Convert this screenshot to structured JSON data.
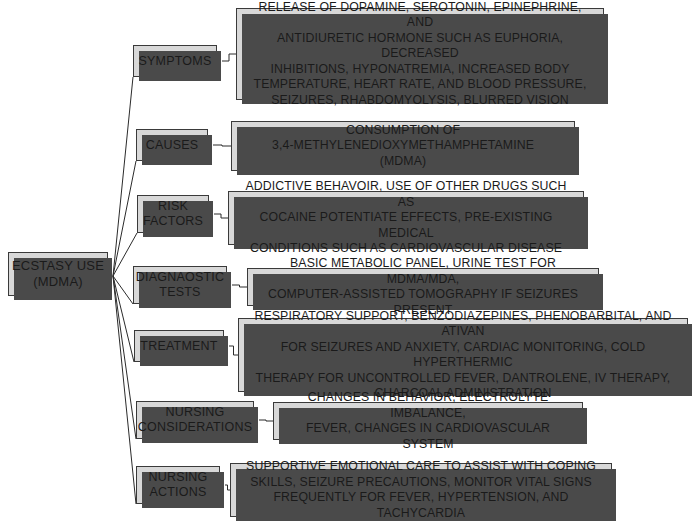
{
  "diagram": {
    "type": "concept-map",
    "background_color": "#ffffff",
    "node_fill_color": "#d8d8d8",
    "node_border_color": "#3a3a3a",
    "node_shadow_color": "#4a4a4a",
    "text_color": "#1a1a1a",
    "root": {
      "label": "ECSTASY USE\n(MDMA)",
      "x": 8,
      "y": 252,
      "width": 100,
      "height": 44
    },
    "branches": [
      {
        "key": "symptoms",
        "label": "SYMPTOMS",
        "label_box": {
          "x": 133,
          "y": 45,
          "width": 84,
          "height": 32
        },
        "detail": "RELEASE OF DOPAMINE, SEROTONIN, EPINEPHRINE, AND\nANTIDIURETIC HORMONE SUCH AS EUPHORIA, DECREASED\nINHIBITIONS, HYPONATREMIA, INCREASED BODY\nTEMPERATURE, HEART RATE, AND BLOOD PRESSURE,\nSEIZURES, RHABDOMYOLYSIS, BLURRED VISION",
        "detail_box": {
          "x": 236,
          "y": 8,
          "width": 368,
          "height": 92
        }
      },
      {
        "key": "causes",
        "label": "CAUSES",
        "label_box": {
          "x": 136,
          "y": 129,
          "width": 72,
          "height": 32
        },
        "detail": "CONSUMPTION OF\n3,4-METHYLENEDIOXYMETHAMPHETAMINE\n(MDMA)",
        "detail_box": {
          "x": 231,
          "y": 121,
          "width": 344,
          "height": 50
        }
      },
      {
        "key": "risk-factors",
        "label": "RISK\nFACTORS",
        "label_box": {
          "x": 137,
          "y": 195,
          "width": 72,
          "height": 38
        },
        "detail": "ADDICTIVE BEHAVOIR, USE OF OTHER DRUGS SUCH AS\nCOCAINE POTENTIATE EFFECTS, PRE-EXISTING MEDICAL\nCONDITIONS SUCH AS CARDIOVASCULAR DISEASE",
        "detail_box": {
          "x": 228,
          "y": 191,
          "width": 356,
          "height": 54
        }
      },
      {
        "key": "diagnostic-tests",
        "label": "DIAGNAOSTIC\nTESTS",
        "label_box": {
          "x": 133,
          "y": 266,
          "width": 94,
          "height": 38
        },
        "detail": "BASIC METABOLIC PANEL, URINE TEST FOR MDMA/MDA,\nCOMPUTER-ASSISTED TOMOGRAPHY IF SEIZURES PRESENT",
        "detail_box": {
          "x": 247,
          "y": 268,
          "width": 352,
          "height": 38
        }
      },
      {
        "key": "treatment",
        "label": "TREATMENT",
        "label_box": {
          "x": 134,
          "y": 330,
          "width": 90,
          "height": 32
        },
        "detail": "RESPIRATORY SUPPORT, BENZODIAZEPINES, PHENOBARBITAL, AND ATIVAN\nFOR SEIZURES AND ANXIETY, CARDIAC MONITORING, COLD HYPERTHERMIC\nTHERAPY FOR UNCONTROLLED FEVER, DANTROLENE, IV THERAPY,\nCHARCOAL ADMINISTRATION",
        "detail_box": {
          "x": 238,
          "y": 318,
          "width": 450,
          "height": 74
        }
      },
      {
        "key": "nursing-considerations",
        "label": "NURSING\nCONSIDERATIONS",
        "label_box": {
          "x": 136,
          "y": 401,
          "width": 118,
          "height": 38
        },
        "detail": "CHANGES IN BEHAVIOR, ELECTROLYTE IMBALANCE,\nFEVER, CHANGES IN CARDIOVASCULAR SYSTEM",
        "detail_box": {
          "x": 273,
          "y": 402,
          "width": 310,
          "height": 38
        }
      },
      {
        "key": "nursing-actions",
        "label": "NURSING\nACTIONS",
        "label_box": {
          "x": 136,
          "y": 466,
          "width": 84,
          "height": 38
        },
        "detail": "SUPPORTIVE EMOTIONAL CARE TO ASSIST WITH COPING\nSKILLS, SEIZURE PRECAUTIONS, MONITOR VITAL SIGNS\nFREQUENTLY FOR FEVER, HYPERTENSION, AND TACHYCARDIA",
        "detail_box": {
          "x": 230,
          "y": 463,
          "width": 382,
          "height": 54
        }
      }
    ]
  }
}
